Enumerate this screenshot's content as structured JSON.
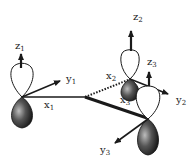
{
  "diagram": {
    "type": "p-orbital coordinate frames",
    "colors": {
      "line": "#1a1a1a",
      "lobe_dark": "#2a2a2a",
      "lobe_light": "#ffffff",
      "background": "#ffffff"
    },
    "frames": [
      {
        "id": 1,
        "axes": [
          {
            "name": "z",
            "sub": "1"
          },
          {
            "name": "y",
            "sub": "1"
          },
          {
            "name": "x",
            "sub": "1"
          }
        ]
      },
      {
        "id": 2,
        "axes": [
          {
            "name": "z",
            "sub": "2"
          },
          {
            "name": "y",
            "sub": "2"
          },
          {
            "name": "x",
            "sub": "2"
          }
        ]
      },
      {
        "id": 3,
        "axes": [
          {
            "name": "z",
            "sub": "3"
          },
          {
            "name": "y",
            "sub": "3"
          },
          {
            "name": "x",
            "sub": "3"
          }
        ]
      }
    ]
  }
}
